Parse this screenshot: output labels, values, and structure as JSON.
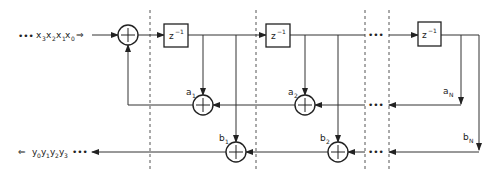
{
  "diagram": {
    "type": "IIR filter direct form II block diagram",
    "input": {
      "dots": "•••",
      "label": "x",
      "subs": [
        "3",
        "2",
        "1",
        "0"
      ],
      "arrow": "⇒"
    },
    "output": {
      "arrow": "⇐",
      "label": "y",
      "subs": [
        "0",
        "1",
        "2",
        "3"
      ],
      "dots": "•••"
    },
    "delay_label": "z",
    "delay_exp": "−1",
    "ellipsis": "•••",
    "feedback_coeffs": [
      {
        "name": "a",
        "sub": "1"
      },
      {
        "name": "a",
        "sub": "2"
      },
      {
        "name": "a",
        "sub": "N"
      }
    ],
    "feedforward_coeffs": [
      {
        "name": "b",
        "sub": "1"
      },
      {
        "name": "b",
        "sub": "2"
      },
      {
        "name": "b",
        "sub": "N"
      }
    ],
    "colors": {
      "line": "#333333",
      "dashed": "#555555",
      "background": "#ffffff"
    }
  }
}
